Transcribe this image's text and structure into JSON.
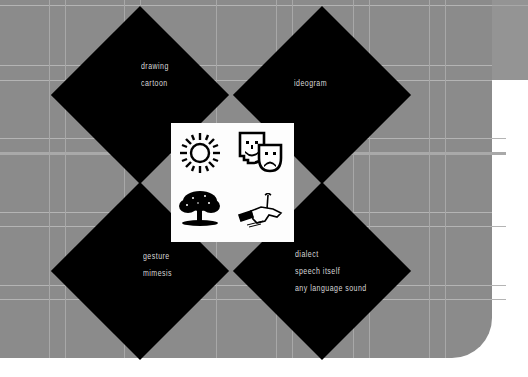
{
  "diagram": {
    "type": "four-quadrant sign-type diagram",
    "quadrants": [
      {
        "id": "top-left",
        "lines": [
          "drawing",
          "cartoon"
        ],
        "icon": "sun-icon"
      },
      {
        "id": "top-right",
        "lines": [
          "ideogram"
        ],
        "icon": "theater-masks-icon"
      },
      {
        "id": "bottom-left",
        "lines": [
          "gesture",
          "mimesis"
        ],
        "icon": "tree-icon"
      },
      {
        "id": "bottom-right",
        "lines": [
          "dialect",
          "speech itself",
          "any language sound"
        ],
        "icon": "fallen-figure-arrow-icon"
      }
    ],
    "colors": {
      "background": "#8b8b8b",
      "strip": "#949494",
      "diamond": "#000000",
      "text": "#d8d8d8",
      "panel": "#fdfdfd",
      "page": "#ffffff"
    }
  }
}
